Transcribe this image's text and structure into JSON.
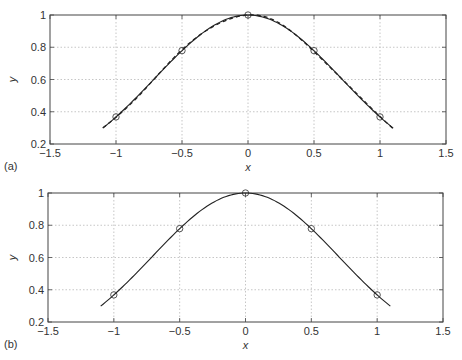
{
  "chart_data": [
    {
      "type": "line",
      "panel_label": "(a)",
      "title": "",
      "xlabel": "x",
      "ylabel": "y",
      "xlim": [
        -1.5,
        1.5
      ],
      "ylim": [
        0.2,
        1
      ],
      "xticks": [
        -1.5,
        -1,
        -0.5,
        0,
        0.5,
        1,
        1.5
      ],
      "xtick_labels": [
        "−1.5",
        "−1",
        "−0.5",
        "0",
        "0.5",
        "1",
        "1.5"
      ],
      "yticks": [
        0.2,
        0.4,
        0.6,
        0.8,
        1
      ],
      "ytick_labels": [
        "0.2",
        "0.4",
        "0.6",
        "0.8",
        "1"
      ],
      "grid": true,
      "legend": null,
      "series": [
        {
          "name": "data points",
          "style": "markers-circle",
          "x": [
            -1,
            -0.5,
            0,
            0.5,
            1
          ],
          "y": [
            0.368,
            0.779,
            1.0,
            0.779,
            0.368
          ]
        },
        {
          "name": "curve",
          "style": "solid",
          "x_range": [
            -1.1,
            1.1
          ],
          "function": "exp(-x^2)"
        },
        {
          "name": "approximation",
          "style": "dashed",
          "x_range": [
            -1.1,
            1.1
          ],
          "function": "approx exp(-x^2)"
        }
      ]
    },
    {
      "type": "line",
      "panel_label": "(b)",
      "title": "",
      "xlabel": "x",
      "ylabel": "y",
      "xlim": [
        -1.5,
        1.5
      ],
      "ylim": [
        0.2,
        1
      ],
      "xticks": [
        -1.5,
        -1,
        -0.5,
        0,
        0.5,
        1,
        1.5
      ],
      "xtick_labels": [
        "−1.5",
        "−1",
        "−0.5",
        "0",
        "0.5",
        "1",
        "1.5"
      ],
      "yticks": [
        0.2,
        0.4,
        0.6,
        0.8,
        1
      ],
      "ytick_labels": [
        "0.2",
        "0.4",
        "0.6",
        "0.8",
        "1"
      ],
      "grid": true,
      "legend": null,
      "series": [
        {
          "name": "data points",
          "style": "markers-circle",
          "x": [
            -1,
            -0.5,
            0,
            0.5,
            1
          ],
          "y": [
            0.368,
            0.779,
            1.0,
            0.779,
            0.368
          ]
        },
        {
          "name": "curve",
          "style": "solid",
          "x_range": [
            -1.1,
            1.1
          ],
          "function": "exp(-x^2)"
        }
      ]
    }
  ],
  "layout": [
    {
      "left": 50,
      "right": 446,
      "top": 15,
      "bottom": 144
    },
    {
      "left": 48,
      "right": 443,
      "top": 193,
      "bottom": 322
    }
  ],
  "colors": {
    "line": "#222222",
    "grid": "#b8b8b8",
    "axes": "#444444",
    "marker": "#444444"
  }
}
